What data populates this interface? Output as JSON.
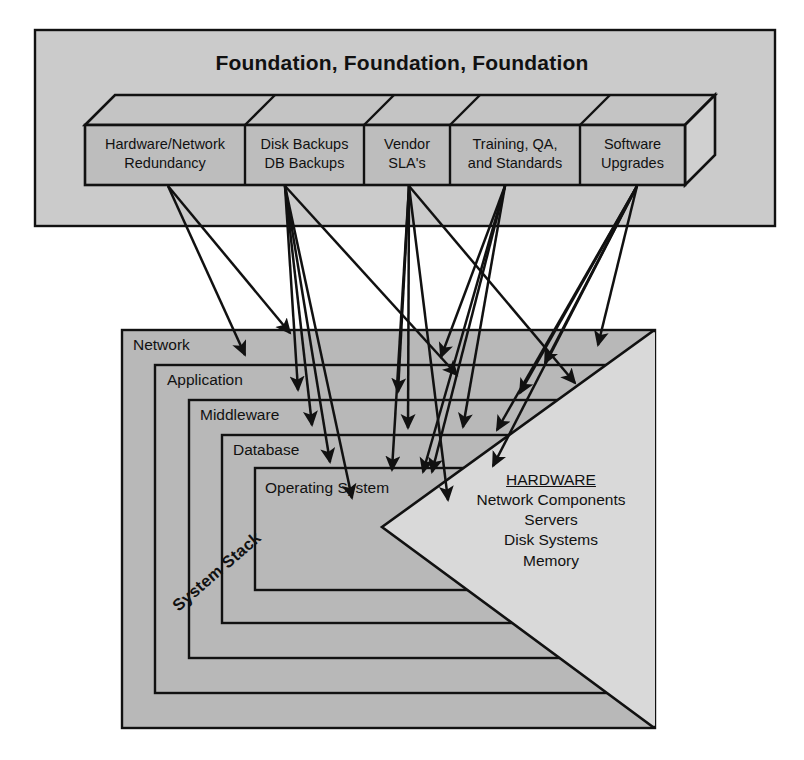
{
  "figure": {
    "title": "Foundation, Foundation, Foundation"
  },
  "colors": {
    "panel_top_bg": "#cbcbcb",
    "panel_bottom_bg": "#b8b8b8",
    "box_fill": "#bdbdbd",
    "box_top_face": "#c4c4c4",
    "box_side_face": "#d0d0d0",
    "wedge_fill": "#d9d9d9",
    "stroke": "#111111",
    "page_bg": "#ffffff"
  },
  "foundation": {
    "panel_name": "foundation-panel",
    "pillars": [
      {
        "id": "hardware-network-redundancy",
        "line1": "Hardware/Network",
        "line2": "Redundancy"
      },
      {
        "id": "disk-db-backups",
        "line1": "Disk Backups",
        "line2": "DB Backups"
      },
      {
        "id": "vendor-slas",
        "line1": "Vendor",
        "line2": "SLA's"
      },
      {
        "id": "training-qa-standards",
        "line1": "Training, QA,",
        "line2": "and Standards"
      },
      {
        "id": "software-upgrades",
        "line1": "Software",
        "line2": "Upgrades"
      }
    ]
  },
  "stack": {
    "panel_name": "system-stack-panel",
    "watermark": "System Stack",
    "layers": [
      {
        "id": "network",
        "label": "Network"
      },
      {
        "id": "application",
        "label": "Application"
      },
      {
        "id": "middleware",
        "label": "Middleware"
      },
      {
        "id": "database",
        "label": "Database"
      },
      {
        "id": "operating-system",
        "label": "Operating System"
      }
    ],
    "hardware": {
      "heading": "HARDWARE",
      "items": [
        "Network Components",
        "Servers",
        "Disk Systems",
        "Memory"
      ]
    }
  }
}
